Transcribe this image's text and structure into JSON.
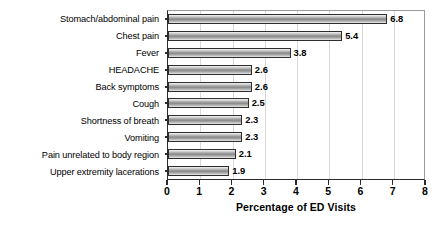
{
  "chart_data": {
    "type": "bar",
    "orientation": "horizontal",
    "title": "",
    "subtitle": "",
    "xlabel": "Percentage of ED Visits",
    "ylabel": "",
    "xlim": [
      0,
      8
    ],
    "xticks": [
      0,
      1,
      2,
      3,
      4,
      5,
      6,
      7,
      8
    ],
    "xticklabels": [
      "0",
      "1",
      "2",
      "3",
      "4",
      "5",
      "6",
      "7",
      "8"
    ],
    "grid": "vertical",
    "legend": "none",
    "bar_color": "#9b9b9b",
    "bar_edge_color": "#2e2e2e",
    "categories": [
      "Stomach/abdominal pain",
      "Chest pain",
      "Fever",
      "HEADACHE",
      "Back symptoms",
      "Cough",
      "Shortness of breath",
      "Vomiting",
      "Pain unrelated to body region",
      "Upper extremity lacerations"
    ],
    "values": [
      6.8,
      5.4,
      3.8,
      2.6,
      2.6,
      2.5,
      2.3,
      2.3,
      2.1,
      1.9
    ],
    "value_labels": [
      "6.8",
      "5.4",
      "3.8",
      "2.6",
      "2.6",
      "2.5",
      "2.3",
      "2.3",
      "2.1",
      "1.9"
    ]
  }
}
